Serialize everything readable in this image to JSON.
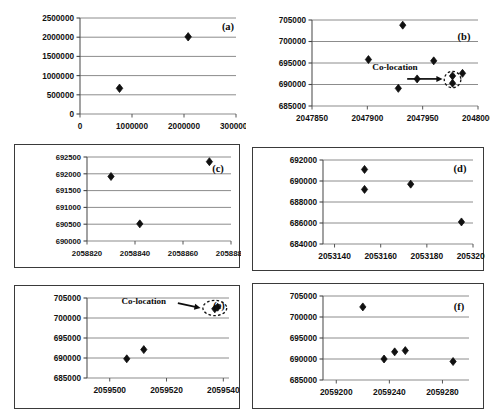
{
  "figure": {
    "background": "#ffffff",
    "panel_count": 6,
    "marker_color": "#101010",
    "gridline_color": "#8c8c8c",
    "axis_color": "#6e6e6e"
  },
  "chart_data": [
    {
      "id": "a",
      "type": "scatter",
      "panel_label": "(a)",
      "title": "",
      "xlabel": "",
      "ylabel": "",
      "boxed": false,
      "xlim": [
        0,
        3000000
      ],
      "ylim": [
        0,
        2500000
      ],
      "xticks": [
        0,
        1000000,
        2000000,
        3000000
      ],
      "yticks": [
        0,
        500000,
        1000000,
        1500000,
        2000000,
        2500000
      ],
      "xticklabels": [
        "0",
        "1000000",
        "2000000",
        "3000000"
      ],
      "yticklabels": [
        "0",
        "500000",
        "1000000",
        "1500000",
        "2000000",
        "2500000"
      ],
      "grid": true,
      "points": [
        {
          "x": 760000,
          "y": 670000
        },
        {
          "x": 2080000,
          "y": 2010000
        }
      ],
      "annotations": []
    },
    {
      "id": "b",
      "type": "scatter",
      "panel_label": "(b)",
      "title": "",
      "xlabel": "",
      "ylabel": "",
      "boxed": false,
      "xlim": [
        2047850,
        2048000
      ],
      "ylim": [
        685000,
        705000
      ],
      "xticks": [
        2047850,
        2047900,
        2047950,
        2048000
      ],
      "yticks": [
        685000,
        690000,
        695000,
        700000,
        705000
      ],
      "xticklabels": [
        "2047850",
        "2047900",
        "2047950",
        "2048000"
      ],
      "yticklabels": [
        "685000",
        "690000",
        "695000",
        "700000",
        "705000"
      ],
      "grid": true,
      "points": [
        {
          "x": 2047901,
          "y": 695800
        },
        {
          "x": 2047928,
          "y": 689100
        },
        {
          "x": 2047932,
          "y": 703800
        },
        {
          "x": 2047945,
          "y": 691300
        },
        {
          "x": 2047960,
          "y": 695500
        },
        {
          "x": 2047977,
          "y": 692000
        },
        {
          "x": 2047977,
          "y": 690300
        },
        {
          "x": 2047986,
          "y": 692600
        }
      ],
      "annotations": [
        {
          "kind": "text",
          "label": "Co-location",
          "x": 2047925,
          "y": 693300
        },
        {
          "kind": "arrow",
          "x1": 2047936,
          "y1": 691300,
          "x2": 2047968,
          "y2": 691300
        },
        {
          "kind": "ellipse",
          "cx": 2047977,
          "cy": 691150,
          "rx": 7.5,
          "ry": 1900
        }
      ]
    },
    {
      "id": "c",
      "type": "scatter",
      "panel_label": "(c)",
      "title": "",
      "xlabel": "",
      "ylabel": "",
      "boxed": true,
      "xlim": [
        2058820,
        2058880
      ],
      "ylim": [
        690000,
        692500
      ],
      "xticks": [
        2058820,
        2058840,
        2058860,
        2058880
      ],
      "yticks": [
        690000,
        690500,
        691000,
        691500,
        692000,
        692500
      ],
      "xticklabels": [
        "2058820",
        "2058840",
        "2058860",
        "2058880"
      ],
      "yticklabels": [
        "690000",
        "690500",
        "691000",
        "691500",
        "692000",
        "692500"
      ],
      "grid": true,
      "points": [
        {
          "x": 2058830,
          "y": 691920
        },
        {
          "x": 2058842,
          "y": 690510
        },
        {
          "x": 2058871,
          "y": 692360
        }
      ],
      "annotations": []
    },
    {
      "id": "d",
      "type": "scatter",
      "panel_label": "(d)",
      "title": "",
      "xlabel": "",
      "ylabel": "",
      "boxed": true,
      "xlim": [
        2053135,
        2053200
      ],
      "ylim": [
        684000,
        692000
      ],
      "xticks": [
        2053140,
        2053160,
        2053180,
        2053200
      ],
      "yticks": [
        684000,
        686000,
        688000,
        690000,
        692000
      ],
      "xticklabels": [
        "2053140",
        "2053160",
        "2053180",
        "2053200"
      ],
      "yticklabels": [
        "684000",
        "686000",
        "688000",
        "690000",
        "692000"
      ],
      "grid": true,
      "points": [
        {
          "x": 2053153,
          "y": 691100
        },
        {
          "x": 2053153,
          "y": 689200
        },
        {
          "x": 2053173,
          "y": 689700
        },
        {
          "x": 2053195,
          "y": 686100
        }
      ],
      "annotations": []
    },
    {
      "id": "e",
      "type": "scatter",
      "panel_label": "(e)",
      "title": "",
      "xlabel": "",
      "ylabel": "",
      "boxed": true,
      "xlim": [
        2059492,
        2059542
      ],
      "ylim": [
        685000,
        705000
      ],
      "xticks": [
        2059500,
        2059520,
        2059540
      ],
      "yticks": [
        685000,
        690000,
        695000,
        700000,
        705000
      ],
      "xticklabels": [
        "2059500",
        "2059520",
        "2059540"
      ],
      "yticklabels": [
        "685000",
        "690000",
        "695000",
        "700000",
        "705000"
      ],
      "grid": true,
      "points": [
        {
          "x": 2059506,
          "y": 689800
        },
        {
          "x": 2059512,
          "y": 692100
        },
        {
          "x": 2059537,
          "y": 702300
        },
        {
          "x": 2059538,
          "y": 702700
        }
      ],
      "annotations": [
        {
          "kind": "text",
          "label": "Co-location",
          "x": 2059512,
          "y": 703600
        },
        {
          "kind": "arrow",
          "x1": 2059524,
          "y1": 703700,
          "x2": 2059532,
          "y2": 702500
        },
        {
          "kind": "ellipse",
          "cx": 2059537,
          "cy": 702500,
          "rx": 4.2,
          "ry": 1900
        }
      ]
    },
    {
      "id": "f",
      "type": "scatter",
      "panel_label": "(f)",
      "title": "",
      "xlabel": "",
      "ylabel": "",
      "boxed": true,
      "xlim": [
        2059190,
        2059300
      ],
      "ylim": [
        685000,
        705000
      ],
      "xticks": [
        2059200,
        2059240,
        2059280
      ],
      "yticks": [
        685000,
        690000,
        695000,
        700000,
        705000
      ],
      "xticklabels": [
        "2059200",
        "2059240",
        "2059280"
      ],
      "yticklabels": [
        "685000",
        "690000",
        "695000",
        "700000",
        "705000"
      ],
      "grid": true,
      "points": [
        {
          "x": 2059220,
          "y": 702400
        },
        {
          "x": 2059236,
          "y": 690000
        },
        {
          "x": 2059244,
          "y": 691700
        },
        {
          "x": 2059252,
          "y": 692000
        },
        {
          "x": 2059288,
          "y": 689400
        }
      ],
      "annotations": []
    }
  ]
}
